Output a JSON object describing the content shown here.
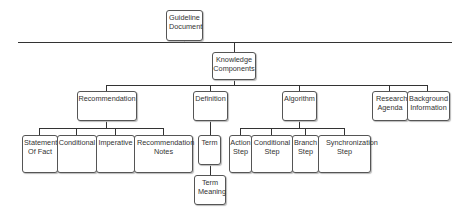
{
  "diagram": {
    "type": "tree",
    "nodes": {
      "root": "Guideline Document",
      "knowledge": "Knowledge Components",
      "recommendation": "Recommendation",
      "definition": "Definition",
      "algorithm": "Algorithm",
      "research": "Research Agenda",
      "background": "Background Information",
      "statement": "Statement Of Fact",
      "conditional": "Conditional",
      "imperative": "Imperative",
      "rec_notes": "Recommendation Notes",
      "term": "Term",
      "term_meaning": "Term Meaning",
      "action_step": "Action Step",
      "conditional_step": "Conditional Step",
      "branch_step": "Branch Step",
      "sync_step": "Synchronization Step"
    },
    "edges": [
      [
        "Guideline Document",
        "Knowledge Components"
      ],
      [
        "Knowledge Components",
        "Recommendation"
      ],
      [
        "Knowledge Components",
        "Definition"
      ],
      [
        "Knowledge Components",
        "Algorithm"
      ],
      [
        "Knowledge Components",
        "Research Agenda"
      ],
      [
        "Knowledge Components",
        "Background Information"
      ],
      [
        "Recommendation",
        "Statement Of Fact"
      ],
      [
        "Recommendation",
        "Conditional"
      ],
      [
        "Recommendation",
        "Imperative"
      ],
      [
        "Recommendation",
        "Recommendation Notes"
      ],
      [
        "Definition",
        "Term"
      ],
      [
        "Term",
        "Term Meaning"
      ],
      [
        "Algorithm",
        "Action Step"
      ],
      [
        "Algorithm",
        "Conditional Step"
      ],
      [
        "Algorithm",
        "Branch Step"
      ],
      [
        "Algorithm",
        "Synchronization Step"
      ]
    ],
    "colors": {
      "line": "#333333",
      "border": "#555555",
      "text": "#333333"
    }
  }
}
